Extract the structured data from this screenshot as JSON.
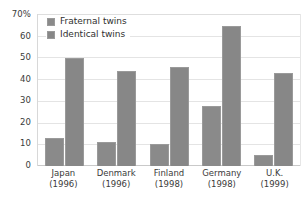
{
  "chart_data": {
    "type": "bar",
    "title": "",
    "xlabel": "",
    "ylabel": "",
    "ylim": [
      0,
      70
    ],
    "ytick_values": [
      0,
      10,
      20,
      30,
      40,
      50,
      60,
      70
    ],
    "ytick_labels": [
      "0",
      "10",
      "20",
      "30",
      "40",
      "50",
      "60",
      "70%"
    ],
    "grid": true,
    "legend_position": "top-left-inside",
    "categories": [
      "Japan",
      "Denmark",
      "Finland",
      "Germany",
      "U.K."
    ],
    "category_years": [
      "(1996)",
      "(1996)",
      "(1998)",
      "(1998)",
      "(1999)"
    ],
    "series": [
      {
        "name": "Fraternal twins",
        "color": "#8a8a8a",
        "values": [
          13,
          11,
          10,
          28,
          5
        ]
      },
      {
        "name": "Identical twins",
        "color": "#878787",
        "values": [
          50,
          44,
          46,
          65,
          43
        ]
      }
    ]
  },
  "colors": {
    "bar_fill": "#8a8a8a",
    "bar_stroke": "#9a9a9a",
    "gridline": "#e4e4e4",
    "axis": "#c9c9c9",
    "text": "#3a3a3a",
    "background": "#ffffff"
  }
}
